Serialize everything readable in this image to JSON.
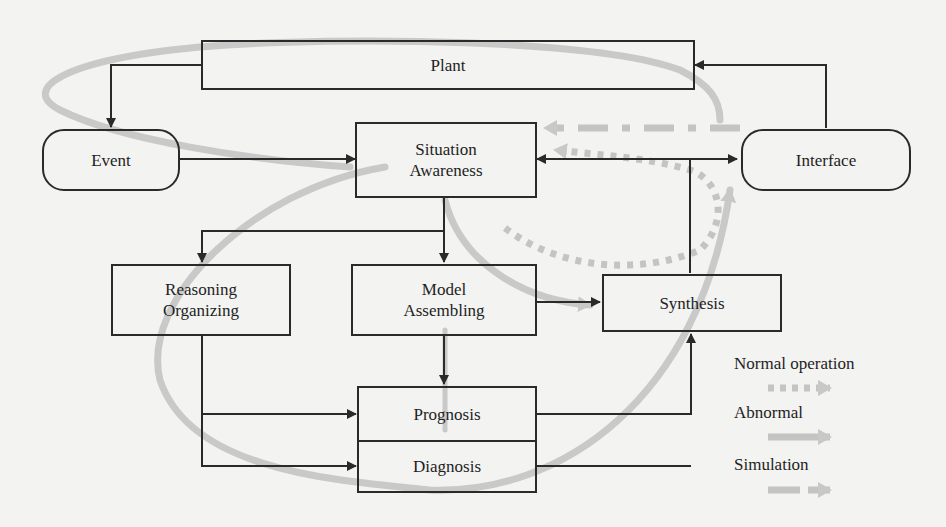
{
  "diagram": {
    "nodes": {
      "plant": {
        "label": "Plant",
        "shape": "rectangle"
      },
      "event": {
        "label": "Event",
        "shape": "rounded"
      },
      "situation_awareness": {
        "line1": "Situation",
        "line2": "Awareness",
        "shape": "rectangle"
      },
      "interface": {
        "label": "Interface",
        "shape": "rounded"
      },
      "reasoning_organizing": {
        "line1": "Reasoning",
        "line2": "Organizing",
        "shape": "rectangle"
      },
      "model_assembling": {
        "line1": "Model",
        "line2": "Assembling",
        "shape": "rectangle"
      },
      "synthesis": {
        "label": "Synthesis",
        "shape": "rectangle"
      },
      "prognosis": {
        "label": "Prognosis",
        "shape": "rectangle"
      },
      "diagnosis": {
        "label": "Diagnosis",
        "shape": "rectangle"
      }
    },
    "edges": [
      {
        "from": "Plant",
        "to": "Event"
      },
      {
        "from": "Event",
        "to": "Situation Awareness"
      },
      {
        "from": "Interface",
        "to": "Plant"
      },
      {
        "from": "Interface",
        "to": "Situation Awareness",
        "bidirectional": true
      },
      {
        "from": "Situation Awareness",
        "to": "Reasoning Organizing"
      },
      {
        "from": "Situation Awareness",
        "to": "Model Assembling"
      },
      {
        "from": "Model Assembling",
        "to": "Synthesis"
      },
      {
        "from": "Model Assembling",
        "to": "Prognosis"
      },
      {
        "from": "Reasoning Organizing",
        "to": "Prognosis"
      },
      {
        "from": "Reasoning Organizing",
        "to": "Diagnosis"
      },
      {
        "from": "Prognosis",
        "to": "Synthesis"
      },
      {
        "from": "Diagnosis",
        "to": "Synthesis"
      }
    ],
    "flows": [
      {
        "name": "Normal operation",
        "style": "dotted",
        "path": "Synthesis → Situation Awareness"
      },
      {
        "name": "Abnormal",
        "style": "solid-grey",
        "path": "Interface → Plant → Event → Situation Awareness → Synthesis; loop through Reasoning/Diagnosis → Interface"
      },
      {
        "name": "Simulation",
        "style": "dashed",
        "path": "Interface → Situation Awareness"
      }
    ],
    "colors": {
      "line": "#2a2a2a",
      "flow": "#c4c4c4",
      "background": "#f3f3f1"
    }
  },
  "legend": {
    "items": [
      {
        "label": "Normal operation",
        "style": "dotted"
      },
      {
        "label": "Abnormal",
        "style": "solid"
      },
      {
        "label": "Simulation",
        "style": "dashed"
      }
    ]
  }
}
